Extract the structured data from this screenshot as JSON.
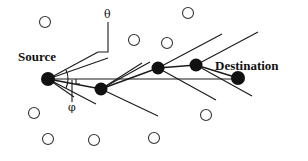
{
  "diagram": {
    "type": "network-routing-sector",
    "background": "#ffffff",
    "stroke_color": "#1a1a1a",
    "labels": {
      "source": "Source",
      "destination": "Destination",
      "theta": "θ",
      "phi": "φ"
    },
    "route_nodes": [
      {
        "id": "source",
        "x": 48,
        "y": 79,
        "filled": true
      },
      {
        "id": "n1",
        "x": 101,
        "y": 89,
        "filled": true
      },
      {
        "id": "n2",
        "x": 158,
        "y": 68,
        "filled": true
      },
      {
        "id": "n3",
        "x": 196,
        "y": 65,
        "filled": true
      },
      {
        "id": "destination",
        "x": 238,
        "y": 78,
        "filled": true
      }
    ],
    "idle_nodes": [
      {
        "x": 45,
        "y": 22
      },
      {
        "x": 134,
        "y": 40
      },
      {
        "x": 167,
        "y": 43
      },
      {
        "x": 188,
        "y": 13
      },
      {
        "x": 34,
        "y": 113
      },
      {
        "x": 48,
        "y": 139
      },
      {
        "x": 94,
        "y": 140
      },
      {
        "x": 154,
        "y": 138
      },
      {
        "x": 206,
        "y": 115
      }
    ],
    "edges": [
      {
        "from": "source",
        "to": "n1"
      },
      {
        "from": "n1",
        "to": "n2"
      },
      {
        "from": "n2",
        "to": "n3"
      },
      {
        "from": "n3",
        "to": "destination"
      },
      {
        "from": "source",
        "to": "destination",
        "direct": true
      }
    ]
  }
}
